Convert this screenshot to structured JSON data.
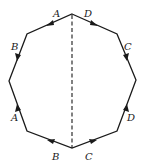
{
  "diagram": {
    "type": "octagon-identification",
    "colors": {
      "line": "#1a1a1a",
      "background": "#ffffff"
    },
    "vertices": [
      [
        72,
        14
      ],
      [
        117,
        34
      ],
      [
        136,
        80
      ],
      [
        117,
        131
      ],
      [
        72,
        148
      ],
      [
        27,
        131
      ],
      [
        9,
        81
      ],
      [
        27,
        34
      ]
    ],
    "axis": {
      "from": [
        72,
        14
      ],
      "to": [
        72,
        148
      ],
      "style": "dashed"
    },
    "edges": [
      {
        "id": "top-left",
        "label": "A",
        "from": [
          72,
          14
        ],
        "to": [
          27,
          34
        ],
        "arrow_dir": "toward-left"
      },
      {
        "id": "upper-left",
        "label": "B",
        "from": [
          27,
          34
        ],
        "to": [
          9,
          81
        ],
        "arrow_dir": "down"
      },
      {
        "id": "lower-left",
        "label": "A",
        "from": [
          27,
          131
        ],
        "to": [
          9,
          81
        ],
        "arrow_dir": "up"
      },
      {
        "id": "bottom-left",
        "label": "B",
        "from": [
          72,
          148
        ],
        "to": [
          27,
          131
        ],
        "arrow_dir": "toward-left"
      },
      {
        "id": "top-right",
        "label": "D",
        "from": [
          72,
          14
        ],
        "to": [
          117,
          34
        ],
        "arrow_dir": "toward-right"
      },
      {
        "id": "upper-right",
        "label": "C",
        "from": [
          117,
          34
        ],
        "to": [
          136,
          80
        ],
        "arrow_dir": "down"
      },
      {
        "id": "lower-right",
        "label": "D",
        "from": [
          117,
          131
        ],
        "to": [
          136,
          80
        ],
        "arrow_dir": "up"
      },
      {
        "id": "bottom-right",
        "label": "C",
        "from": [
          72,
          148
        ],
        "to": [
          117,
          131
        ],
        "arrow_dir": "toward-right"
      }
    ],
    "labels": [
      {
        "text": "A",
        "x": 53,
        "y": 17
      },
      {
        "text": "D",
        "x": 84,
        "y": 17
      },
      {
        "text": "B",
        "x": 11,
        "y": 50
      },
      {
        "text": "C",
        "x": 124,
        "y": 50
      },
      {
        "text": "A",
        "x": 11,
        "y": 121
      },
      {
        "text": "D",
        "x": 127,
        "y": 121
      },
      {
        "text": "B",
        "x": 52,
        "y": 160
      },
      {
        "text": "C",
        "x": 85,
        "y": 160
      }
    ]
  }
}
